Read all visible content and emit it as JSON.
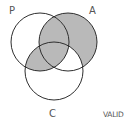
{
  "diagram": {
    "type": "venn",
    "sets": [
      {
        "id": "P",
        "label": "P",
        "cx": 40,
        "cy": 42,
        "r": 29
      },
      {
        "id": "A",
        "label": "A",
        "cx": 68,
        "cy": 42,
        "r": 29
      },
      {
        "id": "C",
        "label": "C",
        "cx": 54,
        "cy": 71,
        "r": 29
      }
    ],
    "shaded_regions": [
      "A only",
      "P and A (not C)",
      "P and A and C",
      "P and C (not A)"
    ],
    "unshaded_regions": [
      "P only",
      "C only",
      "A and C (not P)"
    ],
    "verdict": "VALID",
    "colors": {
      "shade": "#b9b9b9",
      "stroke": "#2e2e2e",
      "background": "#ffffff",
      "label": "#555555"
    }
  }
}
